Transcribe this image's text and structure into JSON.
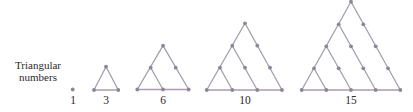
{
  "caption": {
    "line1": "Triangular",
    "line2": "numbers"
  },
  "colors": {
    "line": "#a69eae",
    "dot": "#8e8696",
    "text": "#2a2a2a",
    "background": "#ffffff"
  },
  "figures": [
    {
      "value": 1,
      "label": "1",
      "rows": 1,
      "dots": [
        [
          72.7,
          89.5
        ]
      ],
      "edges": []
    },
    {
      "value": 3,
      "label": "3",
      "rows": 2,
      "dots": [
        [
          106,
          66.7
        ],
        [
          94,
          90
        ],
        [
          118.3,
          90
        ]
      ],
      "edges": [
        [
          106,
          66.7,
          94,
          90
        ],
        [
          106,
          66.7,
          118.3,
          90
        ],
        [
          94,
          90,
          118.3,
          90
        ]
      ]
    },
    {
      "value": 6,
      "label": "6",
      "rows": 3,
      "dots": [
        [
          163,
          45.7
        ],
        [
          150.7,
          67.7
        ],
        [
          175.7,
          67.7
        ],
        [
          137.3,
          89.5
        ],
        [
          163,
          89.5
        ],
        [
          188.7,
          89.5
        ]
      ],
      "edges": [
        [
          163,
          45.7,
          137.3,
          89.5
        ],
        [
          163,
          45.7,
          188.7,
          89.5
        ],
        [
          137.3,
          89.5,
          188.7,
          89.5
        ],
        [
          150.7,
          67.7,
          163,
          89.5
        ]
      ]
    },
    {
      "value": 10,
      "label": "10",
      "rows": 4,
      "dots": [
        [
          245,
          23.3
        ],
        [
          232.3,
          45.7
        ],
        [
          257.3,
          45.7
        ],
        [
          220,
          67.7
        ],
        [
          245,
          67.7
        ],
        [
          270,
          67.7
        ],
        [
          206.7,
          90
        ],
        [
          232.3,
          90
        ],
        [
          257.3,
          90
        ],
        [
          282,
          90
        ]
      ],
      "edges": [
        [
          245,
          23.3,
          206.7,
          90
        ],
        [
          245,
          23.3,
          282,
          90
        ],
        [
          206.7,
          90,
          282,
          90
        ],
        [
          232.3,
          45.7,
          257.3,
          90
        ],
        [
          220,
          67.7,
          232.3,
          90
        ]
      ]
    },
    {
      "value": 15,
      "label": "15",
      "rows": 5,
      "dots": [
        [
          351,
          1.7
        ],
        [
          338.7,
          24.3
        ],
        [
          363.3,
          24.3
        ],
        [
          326.3,
          46.3
        ],
        [
          351,
          46.3
        ],
        [
          375.7,
          46.3
        ],
        [
          314,
          68.3
        ],
        [
          338.7,
          68.3
        ],
        [
          363.3,
          68.3
        ],
        [
          388,
          68.3
        ],
        [
          301.7,
          90
        ],
        [
          326.3,
          90
        ],
        [
          351,
          90
        ],
        [
          375.7,
          90
        ],
        [
          400.3,
          90
        ]
      ],
      "edges": [
        [
          351,
          1.7,
          301.7,
          90
        ],
        [
          351,
          1.7,
          400.3,
          90
        ],
        [
          301.7,
          90,
          400.3,
          90
        ],
        [
          338.7,
          24.3,
          375.7,
          90
        ],
        [
          326.3,
          46.3,
          351,
          90
        ],
        [
          314,
          68.3,
          326.3,
          90
        ]
      ]
    }
  ],
  "labels": [
    {
      "text": "1",
      "x": 73,
      "y": 104
    },
    {
      "text": "3",
      "x": 106,
      "y": 104
    },
    {
      "text": "6",
      "x": 163,
      "y": 104
    },
    {
      "text": "10",
      "x": 245,
      "y": 104
    },
    {
      "text": "15",
      "x": 351,
      "y": 104
    }
  ]
}
